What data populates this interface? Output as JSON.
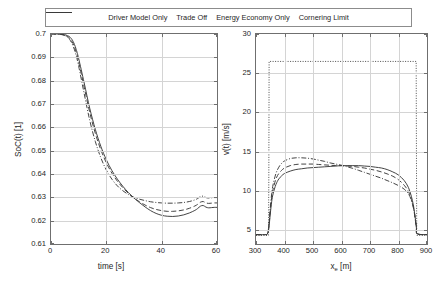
{
  "legend": {
    "position": "top-center",
    "items": [
      {
        "label": "Driver Model Only",
        "style": "solid",
        "color": "#3a3a3a"
      },
      {
        "label": "Trade Off",
        "style": "dashed",
        "color": "#3a3a3a"
      },
      {
        "label": "Energy Economy Only",
        "style": "dashdot",
        "color": "#3a3a3a"
      },
      {
        "label": "Cornering Limit",
        "style": "dotted",
        "color": "#3a3a3a"
      }
    ]
  },
  "chart_data": [
    {
      "id": "soc-panel",
      "type": "line",
      "title": "",
      "xlabel": "time [s]",
      "ylabel": "SoC(t) [1]",
      "xlim": [
        0,
        60
      ],
      "ylim": [
        0.61,
        0.7
      ],
      "xticks": [
        0,
        20,
        40,
        60
      ],
      "xticklabels": [
        "0",
        "20",
        "40",
        "60"
      ],
      "yticks": [
        0.61,
        0.62,
        0.63,
        0.64,
        0.65,
        0.66,
        0.67,
        0.68,
        0.69,
        0.7
      ],
      "yticklabels": [
        "0.61",
        "0.62",
        "0.63",
        "0.64",
        "0.65",
        "0.66",
        "0.67",
        "0.68",
        "0.69",
        "0.7"
      ],
      "grid": true,
      "series": [
        {
          "name": "Driver Model Only",
          "style": "solid",
          "x": [
            0,
            1,
            2,
            3,
            4,
            5,
            6,
            7,
            8,
            9,
            10,
            12,
            14,
            16,
            18,
            20,
            22,
            24,
            26,
            28,
            30,
            32,
            34,
            36,
            38,
            40,
            42,
            44,
            46,
            48,
            50,
            52,
            53,
            54,
            55,
            56,
            57,
            58,
            59,
            60
          ],
          "y": [
            0.7,
            0.7,
            0.7,
            0.7,
            0.6999,
            0.6997,
            0.6993,
            0.6985,
            0.6968,
            0.6938,
            0.6895,
            0.679,
            0.6682,
            0.6592,
            0.6519,
            0.6461,
            0.6415,
            0.6378,
            0.6347,
            0.632,
            0.6297,
            0.6277,
            0.6259,
            0.6243,
            0.6231,
            0.6223,
            0.6219,
            0.6218,
            0.622,
            0.6225,
            0.6233,
            0.6244,
            0.6252,
            0.6262,
            0.6265,
            0.6258,
            0.6255,
            0.6256,
            0.6257,
            0.6257
          ]
        },
        {
          "name": "Trade Off",
          "style": "dashed",
          "x": [
            0,
            1,
            2,
            3,
            4,
            5,
            6,
            7,
            8,
            9,
            10,
            12,
            14,
            16,
            18,
            20,
            22,
            24,
            26,
            28,
            30,
            32,
            34,
            36,
            38,
            40,
            42,
            44,
            46,
            48,
            50,
            52,
            53,
            54,
            55,
            56,
            57,
            58,
            59,
            60
          ],
          "y": [
            0.7,
            0.7,
            0.7,
            0.6999,
            0.6998,
            0.6995,
            0.6989,
            0.6978,
            0.6958,
            0.6926,
            0.688,
            0.6772,
            0.6664,
            0.6575,
            0.6504,
            0.6448,
            0.6404,
            0.6369,
            0.6341,
            0.6317,
            0.6297,
            0.6281,
            0.6267,
            0.6256,
            0.6248,
            0.6243,
            0.624,
            0.624,
            0.6242,
            0.6246,
            0.6253,
            0.6263,
            0.627,
            0.6279,
            0.6282,
            0.6276,
            0.6274,
            0.6275,
            0.6276,
            0.6276
          ]
        },
        {
          "name": "Energy Economy Only",
          "style": "dashdot",
          "x": [
            0,
            1,
            2,
            3,
            4,
            5,
            6,
            7,
            8,
            9,
            10,
            12,
            14,
            16,
            18,
            20,
            22,
            24,
            26,
            28,
            30,
            32,
            34,
            36,
            38,
            40,
            42,
            44,
            46,
            48,
            50,
            52,
            53,
            54,
            55,
            56,
            57,
            58,
            59,
            60
          ],
          "y": [
            0.7,
            0.7,
            0.7,
            0.6999,
            0.6997,
            0.6993,
            0.6986,
            0.6972,
            0.6948,
            0.6912,
            0.6862,
            0.6744,
            0.663,
            0.654,
            0.647,
            0.6417,
            0.6378,
            0.6349,
            0.6328,
            0.6312,
            0.63,
            0.6292,
            0.6286,
            0.6281,
            0.6278,
            0.6276,
            0.6275,
            0.6275,
            0.6276,
            0.6278,
            0.6282,
            0.6289,
            0.6295,
            0.6303,
            0.6305,
            0.6299,
            0.6297,
            0.6298,
            0.6299,
            0.6299
          ]
        }
      ]
    },
    {
      "id": "velocity-panel",
      "type": "line",
      "title": "",
      "xlabel": "x_e [m]",
      "xlabel_base": "x",
      "xlabel_sub": "e",
      "xlabel_unit": " [m]",
      "ylabel": "v(t) [m/s]",
      "xlim": [
        300,
        900
      ],
      "ylim": [
        3.2,
        30
      ],
      "xticks": [
        300,
        400,
        500,
        600,
        700,
        800,
        900
      ],
      "xticklabels": [
        "300",
        "400",
        "500",
        "600",
        "700",
        "800",
        "900"
      ],
      "yticks": [
        5,
        10,
        15,
        20,
        25,
        30
      ],
      "yticklabels": [
        "5",
        "10",
        "15",
        "20",
        "25",
        "30"
      ],
      "grid": true,
      "series": [
        {
          "name": "Cornering Limit",
          "style": "dotted",
          "x": [
            300,
            344,
            345,
            346,
            862,
            863,
            864,
            900
          ],
          "y": [
            4.3,
            4.3,
            12.0,
            26.5,
            26.5,
            14.0,
            4.3,
            4.3
          ]
        },
        {
          "name": "Driver Model Only",
          "style": "solid",
          "x": [
            300,
            330,
            340,
            345,
            350,
            355,
            360,
            370,
            380,
            390,
            400,
            420,
            440,
            460,
            480,
            500,
            520,
            540,
            560,
            580,
            600,
            620,
            640,
            660,
            680,
            700,
            720,
            740,
            760,
            780,
            800,
            820,
            835,
            845,
            852,
            857,
            860,
            863,
            866,
            900
          ],
          "y": [
            4.4,
            4.4,
            4.5,
            5.2,
            7.0,
            8.6,
            9.6,
            10.8,
            11.5,
            11.9,
            12.2,
            12.5,
            12.7,
            12.8,
            12.9,
            12.95,
            13.0,
            13.05,
            13.1,
            13.15,
            13.2,
            13.2,
            13.2,
            13.2,
            13.15,
            13.1,
            13.0,
            12.9,
            12.7,
            12.4,
            12.0,
            11.3,
            10.4,
            9.3,
            8.2,
            7.0,
            6.2,
            5.3,
            4.5,
            4.4
          ]
        },
        {
          "name": "Trade Off",
          "style": "dashed",
          "x": [
            300,
            330,
            340,
            345,
            350,
            355,
            360,
            370,
            380,
            390,
            400,
            420,
            440,
            460,
            480,
            500,
            520,
            540,
            560,
            580,
            600,
            620,
            640,
            660,
            680,
            700,
            720,
            740,
            760,
            780,
            800,
            820,
            835,
            845,
            852,
            857,
            860,
            863,
            866,
            900
          ],
          "y": [
            4.4,
            4.4,
            4.5,
            5.4,
            7.4,
            9.1,
            10.2,
            11.5,
            12.2,
            12.6,
            12.9,
            13.2,
            13.35,
            13.4,
            13.4,
            13.4,
            13.35,
            13.3,
            13.25,
            13.2,
            13.2,
            13.15,
            13.1,
            13.0,
            12.9,
            12.75,
            12.6,
            12.4,
            12.15,
            11.85,
            11.4,
            10.7,
            9.9,
            8.9,
            7.9,
            6.8,
            6.0,
            5.2,
            4.5,
            4.4
          ]
        },
        {
          "name": "Energy Economy Only",
          "style": "dashdot",
          "x": [
            300,
            330,
            340,
            345,
            350,
            355,
            360,
            370,
            380,
            390,
            400,
            420,
            440,
            460,
            480,
            500,
            520,
            540,
            560,
            580,
            600,
            620,
            640,
            660,
            680,
            700,
            720,
            740,
            760,
            780,
            800,
            820,
            835,
            845,
            852,
            857,
            860,
            863,
            866,
            900
          ],
          "y": [
            4.4,
            4.4,
            4.5,
            5.6,
            7.8,
            9.6,
            10.8,
            12.2,
            13.0,
            13.5,
            13.8,
            14.1,
            14.2,
            14.2,
            14.15,
            14.05,
            13.9,
            13.75,
            13.55,
            13.4,
            13.25,
            13.05,
            12.85,
            12.6,
            12.35,
            12.1,
            11.85,
            11.6,
            11.3,
            11.0,
            10.65,
            10.2,
            9.6,
            8.8,
            7.9,
            6.9,
            6.1,
            5.3,
            4.5,
            4.4
          ]
        }
      ]
    }
  ]
}
